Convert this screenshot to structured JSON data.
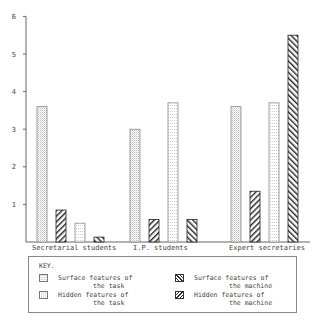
{
  "chart_data": {
    "type": "bar",
    "title": "",
    "xlabel": "",
    "ylabel": "",
    "ylim": [
      0,
      6
    ],
    "yticks": [
      1,
      2,
      3,
      4,
      5,
      6
    ],
    "grid": false,
    "legend_position": "bottom",
    "legend_title": "KEY.",
    "categories": [
      "Secretarial students",
      "I.P. students",
      "Expert secretaries"
    ],
    "series": [
      {
        "name": "Surface features of the task",
        "pattern": "horizontal-dots",
        "values": [
          3.6,
          3.0,
          3.6
        ]
      },
      {
        "name": "Surface features of the machine",
        "pattern": "diagonal-down",
        "values": [
          0.85,
          0.6,
          1.35
        ]
      },
      {
        "name": "Hidden features of the task",
        "pattern": "vertical-dots",
        "values": [
          0.5,
          3.7,
          3.7
        ]
      },
      {
        "name": "Hidden features of the machine",
        "pattern": "diagonal-up",
        "values": [
          0.13,
          0.6,
          5.5
        ]
      }
    ]
  },
  "legend": {
    "title": "KEY.",
    "items": [
      {
        "line1": "Surface features of",
        "line2": "the task"
      },
      {
        "line1": "Hidden features of",
        "line2": "the task"
      },
      {
        "line1": "Surface features of",
        "line2": "the machine"
      },
      {
        "line1": "Hidden features of",
        "line2": "the machine"
      }
    ]
  }
}
